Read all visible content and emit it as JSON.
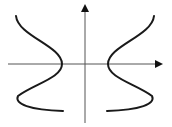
{
  "diagram": {
    "colors": {
      "background": "#ffffff",
      "axis": "#555555",
      "curve": "#1a1a1a"
    },
    "axes": {
      "x_axis": {
        "label": ""
      },
      "y_axis": {
        "label": ""
      }
    },
    "curves": [
      {
        "name": "left-curve",
        "side": "left"
      },
      {
        "name": "right-curve",
        "side": "right"
      }
    ]
  }
}
